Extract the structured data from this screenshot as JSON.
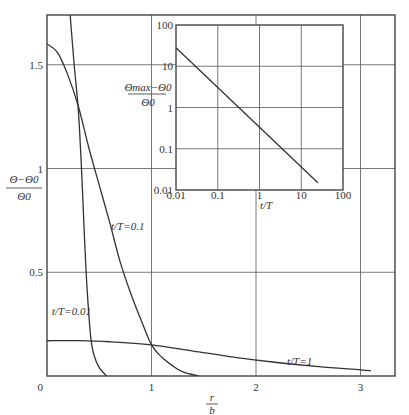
{
  "chart_data": [
    {
      "type": "line",
      "role": "main",
      "title": "",
      "xlabel": {
        "num": "r",
        "den": "b"
      },
      "ylabel": {
        "num": "Θ−Θ0",
        "den": "Θ0"
      },
      "xlim": [
        0,
        3.3
      ],
      "ylim": [
        0,
        1.7
      ],
      "xticks": [
        0,
        1,
        2,
        3
      ],
      "xtick_labels": [
        "0",
        "1",
        "2",
        "3"
      ],
      "yticks": [
        0.5,
        1,
        1.5
      ],
      "ytick_labels": [
        "0.5",
        "1",
        "1.5"
      ],
      "origin_label": "0",
      "grid": true,
      "series": [
        {
          "name": "t/T=0.01",
          "label": "t/T=0.01",
          "x": [
            0.22,
            0.26,
            0.3,
            0.33,
            0.36,
            0.38,
            0.4,
            0.42,
            0.45,
            0.5,
            0.57
          ],
          "y": [
            1.75,
            1.5,
            1.28,
            1.0,
            0.65,
            0.45,
            0.3,
            0.18,
            0.1,
            0.04,
            0.0
          ]
        },
        {
          "name": "t/T=0.1",
          "label": "t/T=0.1",
          "x": [
            0.0,
            0.1,
            0.2,
            0.3,
            0.4,
            0.5,
            0.6,
            0.7,
            0.8,
            0.9,
            1.0,
            1.1,
            1.2,
            1.3,
            1.45
          ],
          "y": [
            1.6,
            1.56,
            1.45,
            1.3,
            1.1,
            0.92,
            0.74,
            0.55,
            0.4,
            0.27,
            0.15,
            0.09,
            0.05,
            0.02,
            0.0
          ]
        },
        {
          "name": "t/T=1",
          "label": "t/T=1",
          "x": [
            0.0,
            0.3,
            0.6,
            1.0,
            1.4,
            1.8,
            2.2,
            2.6,
            3.0,
            3.1
          ],
          "y": [
            0.17,
            0.17,
            0.165,
            0.15,
            0.12,
            0.09,
            0.065,
            0.045,
            0.03,
            0.025
          ]
        }
      ]
    },
    {
      "type": "line",
      "role": "inset",
      "title": "",
      "xlabel": "t/T",
      "ylabel": {
        "num": "Θmax−Θ0",
        "den": "Θ0"
      },
      "xscale": "log",
      "yscale": "log",
      "xlim": [
        0.01,
        100
      ],
      "ylim": [
        0.01,
        100
      ],
      "xtick_labels": [
        "0.01",
        "0.1",
        "1",
        "10",
        "100"
      ],
      "ytick_labels": [
        "0.01",
        "0.1",
        "1",
        "10",
        "100"
      ],
      "grid": true,
      "series": [
        {
          "name": "Θmax",
          "x": [
            0.01,
            25
          ],
          "y": [
            28,
            0.015
          ]
        }
      ]
    }
  ]
}
